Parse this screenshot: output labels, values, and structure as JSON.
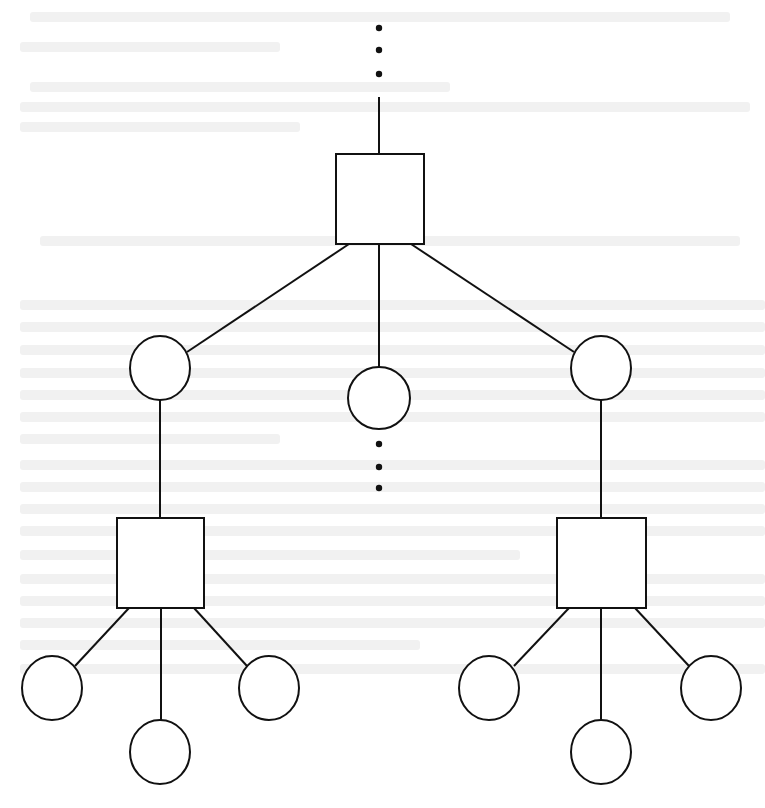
{
  "diagram": {
    "title": "",
    "colors": {
      "stroke": "#111111",
      "fill": "#ffffff",
      "background": "#ffffff"
    },
    "stroke_width": 2,
    "ellipsis_marks": [
      {
        "id": "top-ellipsis",
        "x": 379,
        "ys": [
          28,
          50,
          74
        ],
        "r": 3.2
      },
      {
        "id": "middle-ellipsis",
        "x": 379,
        "ys": [
          444,
          467,
          488
        ],
        "r": 3.2
      }
    ],
    "squares": [
      {
        "id": "root-square",
        "x": 336,
        "y": 154,
        "w": 88,
        "h": 90
      },
      {
        "id": "left-square",
        "x": 117,
        "y": 518,
        "w": 87,
        "h": 90
      },
      {
        "id": "right-square",
        "x": 557,
        "y": 518,
        "w": 89,
        "h": 90
      }
    ],
    "circles": [
      {
        "id": "left-circle",
        "cx": 160,
        "cy": 368,
        "rx": 30,
        "ry": 32
      },
      {
        "id": "middle-circle",
        "cx": 379,
        "cy": 398,
        "rx": 31,
        "ry": 31
      },
      {
        "id": "right-circle",
        "cx": 601,
        "cy": 368,
        "rx": 30,
        "ry": 32
      },
      {
        "id": "left-child-1",
        "cx": 52,
        "cy": 688,
        "rx": 30,
        "ry": 32
      },
      {
        "id": "left-child-2",
        "cx": 160,
        "cy": 752,
        "rx": 30,
        "ry": 32
      },
      {
        "id": "left-child-3",
        "cx": 269,
        "cy": 688,
        "rx": 30,
        "ry": 32
      },
      {
        "id": "right-child-1",
        "cx": 489,
        "cy": 688,
        "rx": 30,
        "ry": 32
      },
      {
        "id": "right-child-2",
        "cx": 601,
        "cy": 752,
        "rx": 30,
        "ry": 32
      },
      {
        "id": "right-child-3",
        "cx": 711,
        "cy": 688,
        "rx": 30,
        "ry": 32
      }
    ],
    "edges": [
      {
        "id": "top-stem",
        "x1": 379,
        "y1": 97,
        "x2": 379,
        "y2": 154
      },
      {
        "id": "root-to-left",
        "x1": 349,
        "y1": 244,
        "x2": 187,
        "y2": 352
      },
      {
        "id": "root-to-middle",
        "x1": 379,
        "y1": 244,
        "x2": 379,
        "y2": 367
      },
      {
        "id": "root-to-right",
        "x1": 411,
        "y1": 244,
        "x2": 574,
        "y2": 352
      },
      {
        "id": "left-circle-to-left-square",
        "x1": 160,
        "y1": 400,
        "x2": 160,
        "y2": 518
      },
      {
        "id": "right-circle-to-right-square",
        "x1": 601,
        "y1": 400,
        "x2": 601,
        "y2": 518
      },
      {
        "id": "left-square-to-child-1",
        "x1": 129,
        "y1": 608,
        "x2": 75,
        "y2": 666
      },
      {
        "id": "left-square-to-child-2",
        "x1": 161,
        "y1": 608,
        "x2": 161,
        "y2": 720
      },
      {
        "id": "left-square-to-child-3",
        "x1": 194,
        "y1": 608,
        "x2": 247,
        "y2": 666
      },
      {
        "id": "right-square-to-child-1",
        "x1": 569,
        "y1": 608,
        "x2": 514,
        "y2": 666
      },
      {
        "id": "right-square-to-child-2",
        "x1": 601,
        "y1": 608,
        "x2": 601,
        "y2": 720
      },
      {
        "id": "right-square-to-child-3",
        "x1": 635,
        "y1": 608,
        "x2": 689,
        "y2": 666
      }
    ]
  }
}
